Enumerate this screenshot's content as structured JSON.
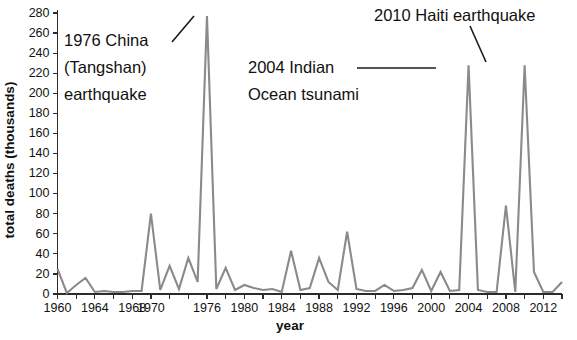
{
  "chart_data": {
    "type": "line",
    "title": "",
    "xlabel": "year",
    "ylabel": "total deaths (thousands)",
    "xlim": [
      1960,
      2014
    ],
    "ylim": [
      0,
      280
    ],
    "ytick_step": 20,
    "xtick_step": 2,
    "xtick_label_step": 4,
    "grid": false,
    "legend": "none",
    "line_color": "#8a8a8a",
    "axis_color": "#2b2b2b",
    "yticks": [
      0,
      20,
      40,
      60,
      80,
      100,
      120,
      140,
      160,
      180,
      200,
      220,
      240,
      260,
      280
    ],
    "ytick_labels": [
      "0",
      "20",
      "40",
      "60",
      "80",
      "100",
      "120",
      "140",
      "160",
      "180",
      "200",
      "220",
      "240",
      "260",
      "280"
    ],
    "xticks": [
      1960,
      1962,
      1964,
      1966,
      1968,
      1970,
      1972,
      1974,
      1976,
      1978,
      1980,
      1982,
      1984,
      1986,
      1988,
      1990,
      1992,
      1994,
      1996,
      1998,
      2000,
      2002,
      2004,
      2006,
      2008,
      2010,
      2012,
      2014
    ],
    "xtick_labels": [
      "1960",
      "",
      "1964",
      "",
      "1968",
      "",
      "1970",
      "",
      "1976",
      "",
      "1980",
      "",
      "1984",
      "",
      "1988",
      "",
      "1992",
      "",
      "1996",
      "",
      "2000",
      "",
      "2004",
      "",
      "2008",
      "",
      "2012",
      ""
    ],
    "xtick_labeled": [
      {
        "x": 1960,
        "label": "1960"
      },
      {
        "x": 1964,
        "label": "1964"
      },
      {
        "x": 1968,
        "label": "1968"
      },
      {
        "x": 1970,
        "label": "1970"
      },
      {
        "x": 1976,
        "label": "1976"
      },
      {
        "x": 1980,
        "label": "1980"
      },
      {
        "x": 1984,
        "label": "1984"
      },
      {
        "x": 1988,
        "label": "1988"
      },
      {
        "x": 1992,
        "label": "1992"
      },
      {
        "x": 1996,
        "label": "1996"
      },
      {
        "x": 2000,
        "label": "2000"
      },
      {
        "x": 2004,
        "label": "2004"
      },
      {
        "x": 2008,
        "label": "2008"
      },
      {
        "x": 2012,
        "label": "2012"
      }
    ],
    "x": [
      1960,
      1961,
      1962,
      1963,
      1964,
      1965,
      1966,
      1967,
      1968,
      1969,
      1970,
      1971,
      1972,
      1973,
      1974,
      1975,
      1976,
      1977,
      1978,
      1979,
      1980,
      1981,
      1982,
      1983,
      1984,
      1985,
      1986,
      1987,
      1988,
      1989,
      1990,
      1991,
      1992,
      1993,
      1994,
      1995,
      1996,
      1997,
      1998,
      1999,
      2000,
      2001,
      2002,
      2003,
      2004,
      2005,
      2006,
      2007,
      2008,
      2009,
      2010,
      2011,
      2012,
      2013,
      2014
    ],
    "values": [
      25,
      1,
      9,
      16,
      2,
      3,
      2,
      2,
      3,
      3,
      80,
      4,
      28,
      5,
      36,
      12,
      277,
      5,
      26,
      4,
      9,
      6,
      4,
      5,
      2,
      43,
      4,
      6,
      36,
      12,
      4,
      62,
      5,
      3,
      3,
      9,
      3,
      4,
      6,
      24,
      3,
      22,
      3,
      4,
      228,
      4,
      2,
      2,
      88,
      2,
      228,
      22,
      2,
      2,
      12
    ],
    "series": [
      {
        "name": "total deaths (thousands)",
        "values": [
          25,
          1,
          9,
          16,
          2,
          3,
          2,
          2,
          3,
          3,
          80,
          4,
          28,
          5,
          36,
          12,
          277,
          5,
          26,
          4,
          9,
          6,
          4,
          5,
          2,
          43,
          4,
          6,
          36,
          12,
          4,
          62,
          5,
          3,
          3,
          9,
          3,
          4,
          6,
          24,
          3,
          22,
          3,
          4,
          228,
          4,
          2,
          2,
          88,
          2,
          228,
          22,
          2,
          2,
          12
        ]
      }
    ],
    "annotations": [
      {
        "id": "china-1976",
        "lines": [
          "1976 China",
          "(Tangshan)",
          "earthquake"
        ],
        "text": "1976 China (Tangshan) earthquake",
        "points_to_year": 1976,
        "points_to_value": 277
      },
      {
        "id": "indian-ocean-2004",
        "lines": [
          "2004 Indian",
          "Ocean tsunami"
        ],
        "text": "2004 Indian Ocean tsunami",
        "points_to_year": 2004,
        "points_to_value": 228
      },
      {
        "id": "haiti-2010",
        "lines": [
          "2010 Haiti earthquake"
        ],
        "text": "2010 Haiti earthquake",
        "points_to_year": 2010,
        "points_to_value": 228
      }
    ]
  }
}
